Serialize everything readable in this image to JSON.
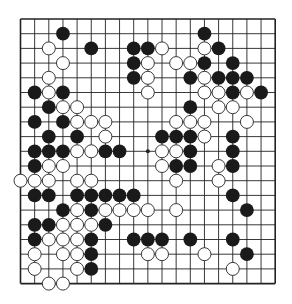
{
  "board": {
    "size": 19,
    "origin_x": 20.5,
    "origin_y": 19,
    "spacing_x": 14.15,
    "spacing_y": 14.7,
    "line_color": "#222222",
    "border_width": 1.6,
    "line_width": 0.9,
    "stone_radius": 6.9,
    "black_color": "#1a1a1a",
    "white_fill": "#ffffff",
    "white_stroke": "#222222",
    "star_points": [
      [
        9,
        9
      ]
    ]
  },
  "stones": {
    "black": [
      [
        3,
        1
      ],
      [
        13,
        1
      ],
      [
        5,
        2
      ],
      [
        8,
        2
      ],
      [
        9,
        2
      ],
      [
        14,
        2
      ],
      [
        8,
        3
      ],
      [
        13,
        3
      ],
      [
        15,
        3
      ],
      [
        8,
        4
      ],
      [
        12,
        4
      ],
      [
        14,
        4
      ],
      [
        15,
        4
      ],
      [
        16,
        4
      ],
      [
        1,
        5
      ],
      [
        3,
        5
      ],
      [
        15,
        5
      ],
      [
        17,
        5
      ],
      [
        2,
        6
      ],
      [
        12,
        6
      ],
      [
        1,
        7
      ],
      [
        3,
        7
      ],
      [
        2,
        8
      ],
      [
        4,
        8
      ],
      [
        10,
        8
      ],
      [
        11,
        8
      ],
      [
        12,
        8
      ],
      [
        15,
        8
      ],
      [
        1,
        9
      ],
      [
        2,
        9
      ],
      [
        3,
        9
      ],
      [
        6,
        9
      ],
      [
        7,
        9
      ],
      [
        12,
        9
      ],
      [
        15,
        9
      ],
      [
        1,
        10
      ],
      [
        11,
        10
      ],
      [
        12,
        10
      ],
      [
        15,
        10
      ],
      [
        1,
        12
      ],
      [
        2,
        12
      ],
      [
        4,
        12
      ],
      [
        5,
        12
      ],
      [
        6,
        12
      ],
      [
        7,
        12
      ],
      [
        8,
        12
      ],
      [
        15,
        12
      ],
      [
        3,
        13
      ],
      [
        5,
        13
      ],
      [
        16,
        13
      ],
      [
        1,
        14
      ],
      [
        2,
        14
      ],
      [
        6,
        14
      ],
      [
        1,
        15
      ],
      [
        5,
        15
      ],
      [
        8,
        15
      ],
      [
        9,
        15
      ],
      [
        10,
        15
      ],
      [
        12,
        15
      ],
      [
        15,
        15
      ],
      [
        5,
        16
      ],
      [
        16,
        16
      ],
      [
        5,
        17
      ]
    ],
    "white": [
      [
        2,
        2
      ],
      [
        10,
        2
      ],
      [
        13,
        2
      ],
      [
        3,
        3
      ],
      [
        9,
        3
      ],
      [
        11,
        3
      ],
      [
        12,
        3
      ],
      [
        2,
        4
      ],
      [
        9,
        4
      ],
      [
        13,
        4
      ],
      [
        2,
        5
      ],
      [
        9,
        5
      ],
      [
        13,
        5
      ],
      [
        14,
        5
      ],
      [
        16,
        5
      ],
      [
        3,
        6
      ],
      [
        4,
        6
      ],
      [
        14,
        6
      ],
      [
        15,
        6
      ],
      [
        4,
        7
      ],
      [
        5,
        7
      ],
      [
        6,
        7
      ],
      [
        11,
        7
      ],
      [
        12,
        7
      ],
      [
        13,
        7
      ],
      [
        16,
        7
      ],
      [
        6,
        8
      ],
      [
        13,
        8
      ],
      [
        4,
        9
      ],
      [
        5,
        9
      ],
      [
        10,
        9
      ],
      [
        11,
        9
      ],
      [
        2,
        10
      ],
      [
        3,
        10
      ],
      [
        10,
        10
      ],
      [
        14,
        10
      ],
      [
        0,
        11
      ],
      [
        1,
        11
      ],
      [
        2,
        11
      ],
      [
        4,
        11
      ],
      [
        5,
        11
      ],
      [
        11,
        11
      ],
      [
        14,
        11
      ],
      [
        4,
        13
      ],
      [
        6,
        13
      ],
      [
        7,
        13
      ],
      [
        8,
        13
      ],
      [
        9,
        13
      ],
      [
        11,
        13
      ],
      [
        3,
        14
      ],
      [
        4,
        14
      ],
      [
        5,
        14
      ],
      [
        2,
        15
      ],
      [
        3,
        15
      ],
      [
        4,
        15
      ],
      [
        1,
        16
      ],
      [
        3,
        16
      ],
      [
        4,
        16
      ],
      [
        9,
        16
      ],
      [
        10,
        16
      ],
      [
        13,
        16
      ],
      [
        1,
        17
      ],
      [
        4,
        17
      ],
      [
        15,
        17
      ],
      [
        2,
        18
      ],
      [
        3,
        18
      ]
    ]
  }
}
